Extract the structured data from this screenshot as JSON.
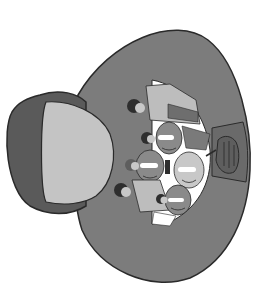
{
  "illustration": {
    "subject": "megaphone with crowd of people inside bell",
    "orientation": "bell facing right, mouthpiece on left",
    "crowd_count": 7,
    "colors": {
      "background": "#ffffff",
      "bell": "#7c7c7c",
      "bell_outline": "#2a2a2a",
      "mouthpiece_outer": "#5a5a5a",
      "mouthpiece_inner": "#c4c4c4",
      "inner_cutout": "#ffffff",
      "face_dark": "#8a8a8a",
      "face_light": "#c8c8c8",
      "hair": "#2e2e2e",
      "shirt": "#bdbdbd",
      "tie": "#6e6e6e",
      "handle": "#6a6a6a",
      "hand": "#5e5e5e"
    }
  }
}
